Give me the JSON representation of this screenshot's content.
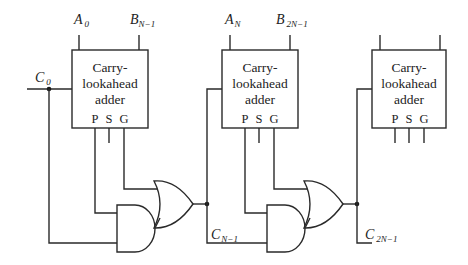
{
  "diagram": {
    "type": "ripple of carry-lookahead adders",
    "blocks": [
      {
        "id": "cla-1",
        "title_lines": [
          "Carry-",
          "lookahead",
          "adder"
        ],
        "inputs": [
          {
            "name": "A",
            "sub": "0"
          },
          {
            "name": "B",
            "sub": "N−1"
          }
        ],
        "outputs": [
          "P",
          "S",
          "G"
        ]
      },
      {
        "id": "cla-2",
        "title_lines": [
          "Carry-",
          "lookahead",
          "adder"
        ],
        "inputs": [
          {
            "name": "A",
            "sub": "N"
          },
          {
            "name": "B",
            "sub": "2N−1"
          }
        ],
        "outputs": [
          "P",
          "S",
          "G"
        ]
      },
      {
        "id": "cla-3",
        "title_lines": [
          "Carry-",
          "lookahead",
          "adder"
        ],
        "inputs": [],
        "outputs": [
          "P",
          "S",
          "G"
        ]
      }
    ],
    "carry_signals": [
      {
        "name": "C",
        "sub": "0"
      },
      {
        "name": "C",
        "sub": "N−1"
      },
      {
        "name": "C",
        "sub": "2N−1"
      }
    ],
    "gates": [
      {
        "type": "AND",
        "stage": 1
      },
      {
        "type": "OR",
        "stage": 1
      },
      {
        "type": "AND",
        "stage": 2
      },
      {
        "type": "OR",
        "stage": 2
      }
    ]
  }
}
